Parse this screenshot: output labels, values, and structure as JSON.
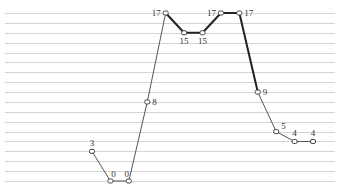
{
  "chart_data": {
    "type": "line",
    "title": "",
    "xlabel": "",
    "ylabel": "",
    "ylim": [
      0,
      17
    ],
    "grid": true,
    "legend": "none",
    "x": [
      1,
      2,
      3,
      4,
      5,
      6,
      7,
      8,
      9,
      10,
      11,
      12,
      13
    ],
    "series": [
      {
        "name": "series",
        "values": [
          3,
          0,
          0,
          8,
          17,
          15,
          15,
          17,
          17,
          9,
          5,
          4,
          4
        ],
        "labels": [
          "3",
          "0",
          "0",
          "8",
          "17",
          "15",
          "15",
          "17",
          "17",
          "9",
          "5",
          "4",
          "4"
        ],
        "emphasized_segments_from_index": [
          4,
          5,
          6,
          7,
          8
        ]
      }
    ]
  }
}
